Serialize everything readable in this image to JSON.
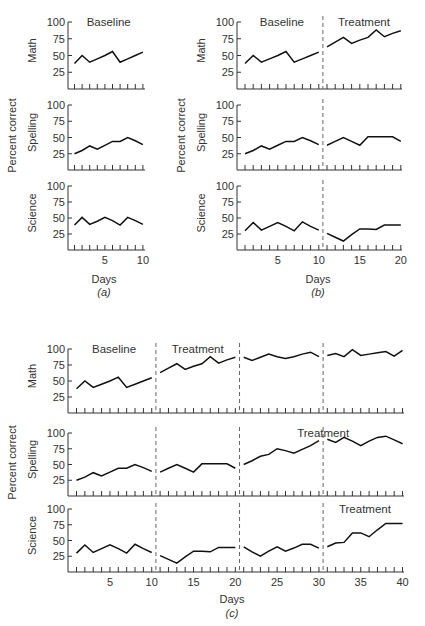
{
  "chart_data": [
    {
      "id": "a",
      "type": "line",
      "caption": "(a)",
      "xlabel": "Days",
      "ylabel": "Percent correct",
      "ylim": [
        0,
        100
      ],
      "yticks": [
        25,
        50,
        75,
        100
      ],
      "xlim": [
        0,
        10
      ],
      "xticks_labeled": [
        5,
        10
      ],
      "phases": [
        {
          "label": "Baseline",
          "start": 1,
          "end": 10
        }
      ],
      "phase_lines": [],
      "x": [
        1,
        2,
        3,
        4,
        5,
        6,
        7,
        8,
        9,
        10
      ],
      "series": [
        {
          "name": "Math",
          "values": [
            38,
            50,
            40,
            45,
            50,
            56,
            40,
            45,
            50,
            55
          ]
        },
        {
          "name": "Spelling",
          "values": [
            25,
            30,
            37,
            32,
            38,
            44,
            44,
            50,
            45,
            39
          ]
        },
        {
          "name": "Science",
          "values": [
            39,
            51,
            40,
            45,
            51,
            46,
            39,
            51,
            46,
            40
          ]
        }
      ]
    },
    {
      "id": "b",
      "type": "line",
      "caption": "(b)",
      "xlabel": "Days",
      "ylabel": "Percent correct",
      "ylim": [
        0,
        100
      ],
      "yticks": [
        25,
        50,
        75,
        100
      ],
      "xlim": [
        0,
        20
      ],
      "xticks_labeled": [
        5,
        10,
        15,
        20
      ],
      "phases": [
        {
          "label": "Baseline",
          "start": 1,
          "end": 10
        },
        {
          "label": "Treatment",
          "start": 11,
          "end": 20
        }
      ],
      "phase_lines": [
        10.5
      ],
      "x": [
        1,
        2,
        3,
        4,
        5,
        6,
        7,
        8,
        9,
        10,
        11,
        12,
        13,
        14,
        15,
        16,
        17,
        18,
        19,
        20
      ],
      "series": [
        {
          "name": "Math",
          "values": [
            38,
            50,
            40,
            45,
            50,
            56,
            40,
            45,
            50,
            55,
            63,
            70,
            77,
            68,
            73,
            77,
            88,
            78,
            83,
            87
          ]
        },
        {
          "name": "Spelling",
          "values": [
            25,
            30,
            37,
            32,
            38,
            44,
            44,
            50,
            45,
            39,
            38,
            44,
            50,
            44,
            38,
            51,
            51,
            51,
            51,
            44
          ]
        },
        {
          "name": "Science",
          "values": [
            30,
            43,
            31,
            37,
            43,
            37,
            30,
            44,
            37,
            31,
            26,
            20,
            14,
            24,
            33,
            33,
            32,
            39,
            39,
            39
          ]
        }
      ]
    },
    {
      "id": "c",
      "type": "line",
      "caption": "(c)",
      "xlabel": "Days",
      "ylabel": "Percent correct",
      "ylim": [
        0,
        100
      ],
      "yticks": [
        25,
        50,
        75,
        100
      ],
      "xlim": [
        0,
        40
      ],
      "xticks_labeled": [
        5,
        10,
        15,
        20,
        25,
        30,
        35,
        40
      ],
      "phase_lines": [
        10.5,
        20.5,
        30.5
      ],
      "x": [
        1,
        2,
        3,
        4,
        5,
        6,
        7,
        8,
        9,
        10,
        11,
        12,
        13,
        14,
        15,
        16,
        17,
        18,
        19,
        20,
        21,
        22,
        23,
        24,
        25,
        26,
        27,
        28,
        29,
        30,
        31,
        32,
        33,
        34,
        35,
        36,
        37,
        38,
        39,
        40
      ],
      "series": [
        {
          "name": "Math",
          "phases": [
            {
              "label": "Baseline",
              "start": 1,
              "end": 10
            },
            {
              "label": "Treatment",
              "start": 11,
              "end": 40
            }
          ],
          "values": [
            38,
            50,
            40,
            45,
            50,
            56,
            40,
            45,
            50,
            55,
            63,
            70,
            77,
            68,
            73,
            77,
            88,
            78,
            83,
            87,
            87,
            82,
            87,
            92,
            88,
            85,
            88,
            92,
            95,
            88,
            90,
            93,
            88,
            99,
            90,
            92,
            94,
            96,
            89,
            98
          ]
        },
        {
          "name": "Spelling",
          "phases": [
            {
              "label": "Treatment",
              "start": 21,
              "end": 40
            }
          ],
          "values": [
            25,
            30,
            37,
            32,
            38,
            44,
            44,
            50,
            45,
            39,
            38,
            44,
            50,
            44,
            38,
            51,
            51,
            51,
            51,
            44,
            50,
            56,
            63,
            66,
            75,
            72,
            68,
            74,
            80,
            88,
            90,
            85,
            93,
            87,
            80,
            87,
            93,
            95,
            89,
            83
          ]
        },
        {
          "name": "Science",
          "phases": [
            {
              "label": "Treatment",
              "start": 31,
              "end": 40
            }
          ],
          "values": [
            30,
            43,
            31,
            37,
            43,
            37,
            30,
            44,
            37,
            31,
            26,
            20,
            14,
            24,
            33,
            33,
            32,
            39,
            39,
            39,
            40,
            32,
            25,
            33,
            40,
            33,
            38,
            44,
            44,
            38,
            40,
            46,
            47,
            62,
            62,
            56,
            67,
            77,
            77,
            77
          ]
        }
      ]
    }
  ]
}
